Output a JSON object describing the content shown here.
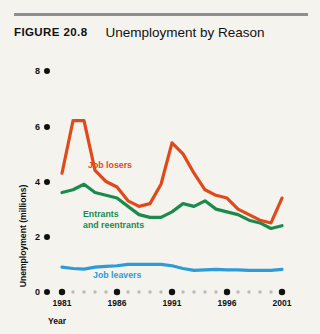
{
  "figure": {
    "number_label": "FIGURE  20.8",
    "title": "Unemployment by Reason"
  },
  "colors": {
    "job_losers": "#e04a1a",
    "entrants": "#1a8b4c",
    "job_leavers": "#2e9bd8",
    "axis": "#111111",
    "minor_tick": "#b9b9b9",
    "background": "#f4f3ee",
    "header_rule": "#8e8e8e"
  },
  "labels": {
    "job_losers": "Job losers",
    "entrants_line1": "Entrants",
    "entrants_line2": "and reentrants",
    "job_leavers": "Job leavers",
    "yaxis_title": "Unemployment (millions)",
    "xaxis_title": "Year"
  },
  "axis": {
    "y_ticks": [
      "0",
      "2",
      "4",
      "6",
      "8"
    ],
    "x_major_ticks": [
      "1981",
      "1986",
      "1991",
      "1996",
      "2001"
    ]
  },
  "chart_data": {
    "type": "line",
    "title": "Unemployment by Reason",
    "xlabel": "Year",
    "ylabel": "Unemployment (millions)",
    "xlim": [
      1981,
      2001
    ],
    "ylim": [
      0,
      8
    ],
    "ytick_values": [
      0,
      2,
      4,
      6,
      8
    ],
    "xtick_major": [
      1981,
      1986,
      1991,
      1996,
      2001
    ],
    "grid": false,
    "legend": "inline-annotations",
    "x": [
      1981,
      1982,
      1983,
      1984,
      1985,
      1986,
      1987,
      1988,
      1989,
      1990,
      1991,
      1992,
      1993,
      1994,
      1995,
      1996,
      1997,
      1998,
      1999,
      2000,
      2001
    ],
    "series": [
      {
        "name": "Job losers",
        "color": "#e04a1a",
        "values": [
          4.3,
          6.2,
          6.2,
          4.4,
          4.0,
          3.8,
          3.3,
          3.1,
          3.2,
          3.9,
          5.4,
          5.0,
          4.3,
          3.7,
          3.5,
          3.4,
          3.0,
          2.8,
          2.6,
          2.5,
          3.4
        ]
      },
      {
        "name": "Entrants and reentrants",
        "color": "#1a8b4c",
        "values": [
          3.6,
          3.7,
          3.9,
          3.6,
          3.5,
          3.4,
          3.1,
          2.8,
          2.7,
          2.7,
          2.9,
          3.2,
          3.1,
          3.3,
          3.0,
          2.9,
          2.8,
          2.6,
          2.5,
          2.3,
          2.4
        ]
      },
      {
        "name": "Job leavers",
        "color": "#2e9bd8",
        "values": [
          0.9,
          0.85,
          0.83,
          0.9,
          0.93,
          0.95,
          1.0,
          1.0,
          1.0,
          1.0,
          0.95,
          0.85,
          0.78,
          0.8,
          0.82,
          0.8,
          0.8,
          0.78,
          0.78,
          0.78,
          0.82
        ]
      }
    ]
  }
}
